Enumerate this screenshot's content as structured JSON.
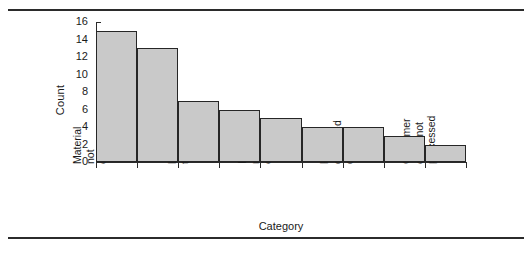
{
  "chart_data": {
    "type": "bar",
    "title": "",
    "xlabel": "Category",
    "ylabel": "Count",
    "ylim": [
      0,
      16
    ],
    "yticks": [
      0,
      2,
      4,
      6,
      8,
      10,
      12,
      14,
      16
    ],
    "grid": false,
    "legend": null,
    "bar_color": "#c9c9c9",
    "bar_edge_color": "#262626",
    "categories": [
      "Material not ordered",
      "",
      "Lead time too short",
      "",
      "Incorrect material ordered",
      "",
      "Parts damaged during",
      "",
      "Customer order not processed"
    ],
    "category_lines": [
      [
        "Material",
        "not",
        "ordered"
      ],
      [],
      [
        "Lead time",
        "too short"
      ],
      [],
      [
        "Incorrect",
        "material",
        "ordered"
      ],
      [],
      [
        "Parts",
        "damaged",
        "during"
      ],
      [],
      [
        "Customer",
        "order not",
        "processed"
      ]
    ],
    "values": [
      15,
      13,
      7,
      6,
      5,
      4,
      4,
      3,
      2
    ]
  }
}
